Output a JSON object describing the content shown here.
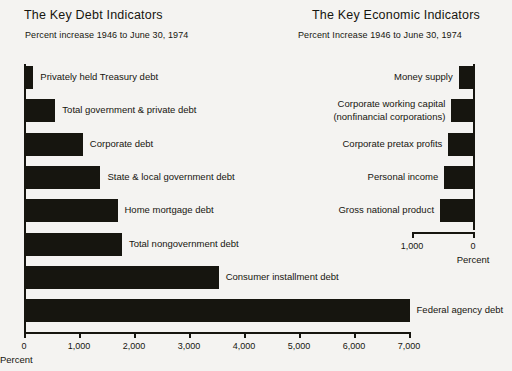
{
  "chart_data": [
    {
      "type": "bar",
      "orientation": "horizontal",
      "title": "The Key Debt Indicators",
      "subtitle": "Percent increase 1946 to June 30, 1974",
      "xlabel": "Percent",
      "ylabel": "",
      "xlim": [
        0,
        7000
      ],
      "xticks": [
        0,
        1000,
        2000,
        3000,
        4000,
        5000,
        6000,
        7000
      ],
      "xticklabels": [
        "0",
        "1,000",
        "2,000",
        "3,000",
        "4,000",
        "5,000",
        "6,000",
        "7,000"
      ],
      "grid": false,
      "legend": false,
      "direction": "left-to-right",
      "categories": [
        "Privately held Treasury debt",
        "Total government & private debt",
        "Corporate debt",
        "State & local government debt",
        "Home mortgage debt",
        "Total nongovernment debt",
        "Consumer  installment debt",
        "Federal agency debt"
      ],
      "values": [
        170,
        570,
        1070,
        1390,
        1700,
        1780,
        3540,
        7010
      ]
    },
    {
      "type": "bar",
      "orientation": "horizontal",
      "title": "The Key Economic Indicators",
      "subtitle": "Percent Increase 1946 to June 30, 1974",
      "xlabel": "Percent",
      "ylabel": "",
      "xlim": [
        0,
        1000
      ],
      "xticks": [
        1000,
        0
      ],
      "xticklabels": [
        "1,000",
        "0"
      ],
      "grid": false,
      "legend": false,
      "direction": "right-to-left",
      "categories": [
        "Money supply",
        "Corporate working capital\n(nonfinancial corporations)",
        "Corporate pretax profits",
        "Personal income",
        "Gross national product"
      ],
      "values": [
        235,
        355,
        405,
        470,
        540
      ]
    }
  ],
  "debt": {
    "title": "The Key Debt Indicators",
    "subtitle": "Percent increase 1946 to June 30, 1974",
    "axis_title": "Percent",
    "ticks": [
      "0",
      "1,000",
      "2,000",
      "3,000",
      "4,000",
      "5,000",
      "6,000",
      "7,000"
    ],
    "bars": [
      {
        "label": "Privately held Treasury debt",
        "value": 170
      },
      {
        "label": "Total government & private debt",
        "value": 570
      },
      {
        "label": "Corporate debt",
        "value": 1070
      },
      {
        "label": "State & local government debt",
        "value": 1390
      },
      {
        "label": "Home mortgage debt",
        "value": 1700
      },
      {
        "label": "Total nongovernment debt",
        "value": 1780
      },
      {
        "label": "Consumer  installment debt",
        "value": 3540
      },
      {
        "label": "Federal agency debt",
        "value": 7010
      }
    ]
  },
  "econ": {
    "title": "The Key Economic Indicators",
    "subtitle": "Percent Increase 1946 to June 30, 1974",
    "axis_title": "Percent",
    "ticks": [
      "1,000",
      "0"
    ],
    "bars": [
      {
        "label": "Money supply",
        "label2": "",
        "value": 235
      },
      {
        "label": "Corporate working capital",
        "label2": "(nonfinancial corporations)",
        "value": 355
      },
      {
        "label": "Corporate pretax profits",
        "label2": "",
        "value": 405
      },
      {
        "label": "Personal income",
        "label2": "",
        "value": 470
      },
      {
        "label": "Gross national product",
        "label2": "",
        "value": 540
      }
    ]
  },
  "style": {
    "ink": "#16150f",
    "background": "#f4f3f1"
  }
}
